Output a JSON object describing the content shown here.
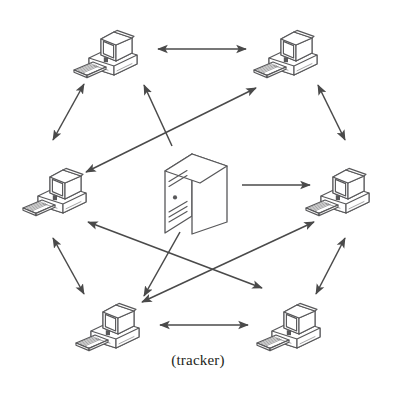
{
  "figure": {
    "caption": "(tracker)",
    "title": "",
    "stroke_color": "#4a4a4a",
    "icon_stroke_color": "#58585a",
    "background_color": "#ffffff",
    "text_color": "#231f20"
  },
  "nodes": [
    {
      "id": "peer-top-left",
      "label": "",
      "type": "desktop-computer",
      "x": 108,
      "y": 48,
      "scale": 1.0
    },
    {
      "id": "peer-top-right",
      "label": "",
      "type": "desktop-computer",
      "x": 288,
      "y": 48,
      "scale": 1.0
    },
    {
      "id": "peer-middle-left",
      "label": "",
      "type": "desktop-computer",
      "x": 57,
      "y": 186,
      "scale": 1.0
    },
    {
      "id": "peer-middle-right",
      "label": "",
      "type": "desktop-computer",
      "x": 340,
      "y": 186,
      "scale": 1.0
    },
    {
      "id": "peer-bottom-left",
      "label": "",
      "type": "desktop-computer",
      "x": 110,
      "y": 321,
      "scale": 1.0
    },
    {
      "id": "peer-bottom-right",
      "label": "",
      "type": "desktop-computer",
      "x": 291,
      "y": 321,
      "scale": 1.0
    },
    {
      "id": "tracker-server",
      "label": "(tracker)",
      "type": "server-tower",
      "x": 196,
      "y": 192,
      "scale": 1.0
    }
  ],
  "edges": [
    {
      "id": "edge-top-left-top-right",
      "from": "peer-top-left",
      "to": "peer-top-right",
      "arrow": "double",
      "x1": 158,
      "y1": 49,
      "x2": 246,
      "y2": 49
    },
    {
      "id": "edge-bottom-left-bottom-right",
      "from": "peer-bottom-left",
      "to": "peer-bottom-right",
      "arrow": "double",
      "x1": 160,
      "y1": 325,
      "x2": 248,
      "y2": 325
    },
    {
      "id": "edge-top-left-middle-left",
      "from": "peer-top-left",
      "to": "peer-middle-left",
      "arrow": "double",
      "x1": 84,
      "y1": 84,
      "x2": 53,
      "y2": 140
    },
    {
      "id": "edge-top-right-middle-right",
      "from": "peer-top-right",
      "to": "peer-middle-right",
      "arrow": "double",
      "x1": 318,
      "y1": 85,
      "x2": 345,
      "y2": 140
    },
    {
      "id": "edge-middle-left-bottom-left",
      "from": "peer-middle-left",
      "to": "peer-bottom-left",
      "arrow": "double",
      "x1": 53,
      "y1": 238,
      "x2": 84,
      "y2": 294
    },
    {
      "id": "edge-middle-right-bottom-right",
      "from": "peer-middle-right",
      "to": "peer-bottom-right",
      "arrow": "double",
      "x1": 345,
      "y1": 238,
      "x2": 316,
      "y2": 294
    },
    {
      "id": "edge-middle-left-top-right",
      "from": "peer-middle-left",
      "to": "peer-top-right",
      "arrow": "double",
      "x1": 86,
      "y1": 172,
      "x2": 256,
      "y2": 88
    },
    {
      "id": "edge-middle-left-bottom-right",
      "from": "peer-middle-left",
      "to": "peer-bottom-right",
      "arrow": "double",
      "x1": 88,
      "y1": 222,
      "x2": 262,
      "y2": 288
    },
    {
      "id": "edge-bottom-left-middle-right",
      "from": "peer-bottom-left",
      "to": "peer-middle-right",
      "arrow": "double",
      "x1": 142,
      "y1": 302,
      "x2": 314,
      "y2": 222
    },
    {
      "id": "edge-tracker-top-left",
      "from": "tracker-server",
      "to": "peer-top-left",
      "arrow": "single",
      "x1": 172,
      "y1": 146,
      "x2": 144,
      "y2": 85
    },
    {
      "id": "edge-tracker-middle-right",
      "from": "tracker-server",
      "to": "peer-middle-right",
      "arrow": "single",
      "x1": 242,
      "y1": 185,
      "x2": 310,
      "y2": 185
    },
    {
      "id": "edge-tracker-bottom-left",
      "from": "tracker-server",
      "to": "peer-bottom-left",
      "arrow": "single",
      "x1": 180,
      "y1": 232,
      "x2": 144,
      "y2": 296
    }
  ],
  "legend": {
    "double_arrow_meaning": "peer-to-peer exchange",
    "single_arrow_meaning": "tracker announcement"
  }
}
